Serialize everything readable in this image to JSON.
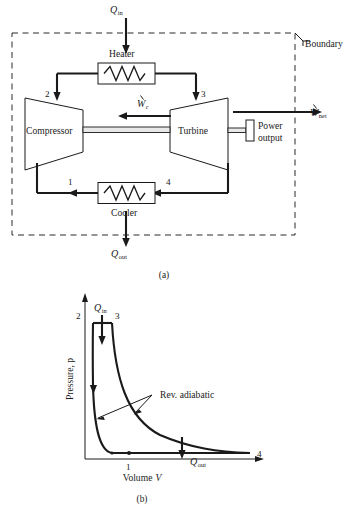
{
  "figure": {
    "panel_a": {
      "caption": "(a)",
      "boundary_label": "Boundary",
      "components": {
        "heater": "Heater",
        "cooler": "Cooler",
        "compressor": "Compressor",
        "turbine": "Turbine",
        "power_output_line1": "Power",
        "power_output_line2": "output"
      },
      "flows": {
        "q_in_symbol": "Q",
        "q_in_sub": "in",
        "q_out_symbol": "Q",
        "q_out_sub": "out",
        "w_net_symbol": "W",
        "w_net_sub": "net",
        "w_c_symbol": "W",
        "w_c_sub": "c"
      },
      "state_points": [
        "1",
        "2",
        "3",
        "4"
      ]
    },
    "panel_b": {
      "caption": "(b)",
      "ylabel": "Pressure, p",
      "xlabel_text": "Volume",
      "xlabel_var": "V",
      "annotation": "Rev. adiabatic",
      "q_in_symbol": "Q",
      "q_in_sub": "in",
      "q_out_symbol": "Q",
      "q_out_sub": "out",
      "state_points": [
        "1",
        "2",
        "3",
        "4"
      ]
    }
  },
  "colors": {
    "ink": "#1a1a1a",
    "paper": "#ffffff",
    "dashed": "#2a2a2a"
  }
}
